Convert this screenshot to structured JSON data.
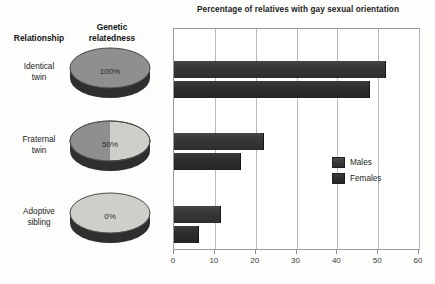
{
  "chart_data": {
    "type": "bar",
    "orientation": "horizontal",
    "title": "Percentage of relatives with gay sexual orientation",
    "xlabel": "",
    "ylabel": "",
    "categories": [
      "Identical twin",
      "Fraternal twin",
      "Adoptive sibling"
    ],
    "series": [
      {
        "name": "Males",
        "values": [
          52,
          22,
          11.5
        ]
      },
      {
        "name": "Females",
        "values": [
          48,
          16.5,
          6
        ]
      }
    ],
    "xlim": [
      0,
      60
    ],
    "xticks": [
      0,
      10,
      20,
      30,
      40,
      50,
      60
    ],
    "xtick_labels": [
      "0",
      "10",
      "20",
      "30",
      "40",
      "50",
      "60"
    ],
    "grid": "vertical",
    "legend_position": "right-middle"
  },
  "headers": {
    "relationship": "Relationship",
    "genetic_relatedness": "Genetic\nrelatedness",
    "genetic_relatedness_line1": "Genetic",
    "genetic_relatedness_line2": "relatedness"
  },
  "rows": [
    {
      "label": "Identical twin",
      "label_line1": "Identical",
      "label_line2": "twin",
      "relatedness": "100%",
      "relatedness_fraction": 1.0,
      "males": 52,
      "females": 48
    },
    {
      "label": "Fraternal twin",
      "label_line1": "Fraternal",
      "label_line2": "twin",
      "relatedness": "50%",
      "relatedness_fraction": 0.5,
      "males": 22,
      "females": 16.5
    },
    {
      "label": "Adoptive sibling",
      "label_line1": "Adoptive",
      "label_line2": "sibling",
      "relatedness": "0%",
      "relatedness_fraction": 0.0,
      "males": 11.5,
      "females": 6
    }
  ],
  "legend": {
    "items": [
      {
        "label": "Males",
        "color": "#3a3a3a"
      },
      {
        "label": "Females",
        "color": "#2d2d2d"
      }
    ]
  },
  "colors": {
    "bar_males": "#3a3a3a",
    "bar_females": "#2d2d2d",
    "disc_dark": "#8e8e8e",
    "disc_light": "#cfcfcb",
    "disc_edge": "#3c3c3c",
    "plot_border": "#9a9a9a",
    "gridline": "#b9b9b9",
    "background": "#fdfdfc",
    "text": "#1b1b1b"
  }
}
